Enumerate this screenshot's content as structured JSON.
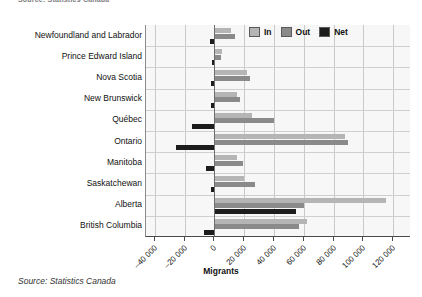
{
  "top_caption": "Source: Statistics Canada",
  "source_note": "Source: Statistics Canada",
  "legend": {
    "position": "top-right",
    "items": [
      {
        "label": "In",
        "color": "#b5b5b5"
      },
      {
        "label": "Out",
        "color": "#8a8a8a"
      },
      {
        "label": "Net",
        "color": "#1c1c1c"
      }
    ]
  },
  "chart_data": {
    "type": "bar",
    "orientation": "horizontal",
    "title": "",
    "subtitle": "",
    "xlabel": "Migrants",
    "ylabel": "",
    "xlim": [
      -46000,
      132000
    ],
    "xticks": [
      -40000,
      -20000,
      0,
      20000,
      40000,
      60000,
      80000,
      100000,
      120000
    ],
    "xticklabels": [
      "–40 000",
      "–20 000",
      "0",
      "20 000",
      "40 000",
      "60 000",
      "80 000",
      "100 000",
      "120 000"
    ],
    "grid": true,
    "categories": [
      "Newfoundland and Labrador",
      "Prince Edward Island",
      "Nova Scotia",
      "New Brunswick",
      "Québec",
      "Ontario",
      "Manitoba",
      "Saskatchewan",
      "Alberta",
      "British Columbia"
    ],
    "series": [
      {
        "name": "In",
        "color": "#b5b5b5",
        "values": [
          11000,
          5000,
          22000,
          15000,
          25000,
          88000,
          15000,
          20000,
          115000,
          62000
        ]
      },
      {
        "name": "Out",
        "color": "#8a8a8a",
        "values": [
          14000,
          4500,
          24000,
          17000,
          40000,
          90000,
          19000,
          27000,
          60000,
          57000
        ]
      },
      {
        "name": "Net",
        "color": "#1c1c1c",
        "values": [
          -3000,
          -1500,
          -2500,
          -2500,
          -15000,
          -26000,
          -6000,
          -2500,
          55000,
          -7000
        ]
      }
    ]
  }
}
